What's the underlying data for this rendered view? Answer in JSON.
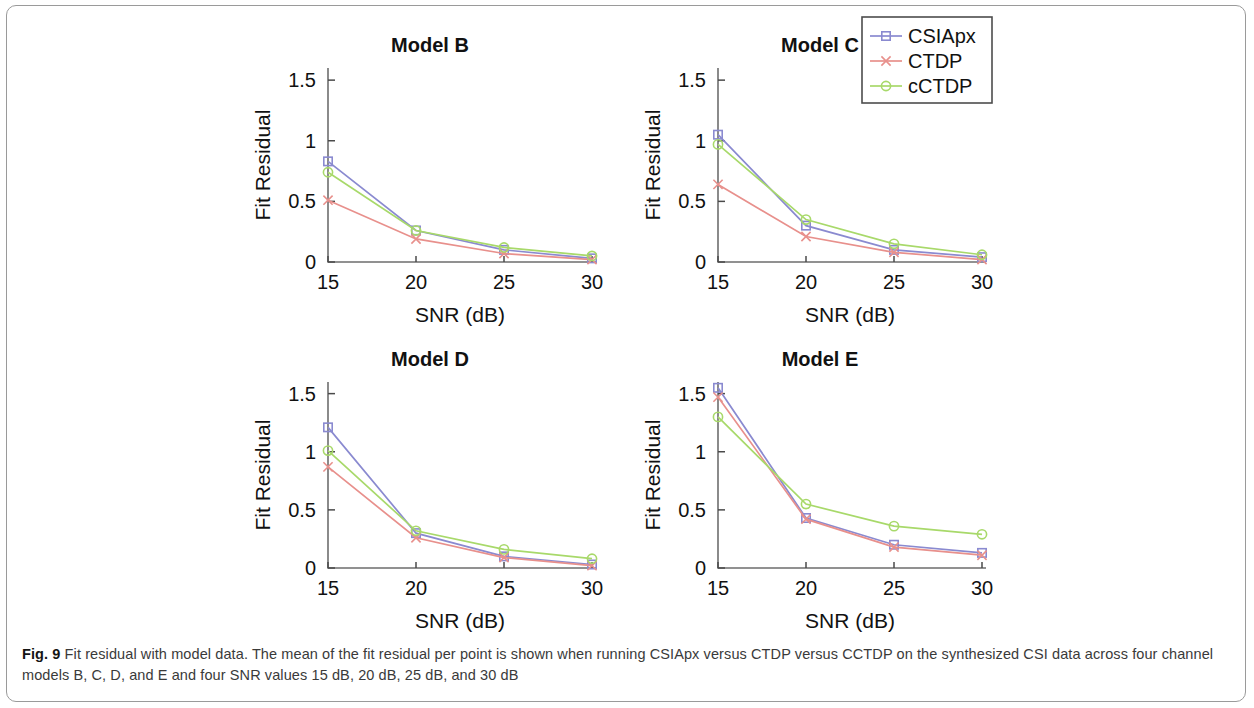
{
  "figure": {
    "caption_label": "Fig. 9",
    "caption_text": " Fit residual with model data. The mean of the fit residual per point is shown when running CSIApx versus CTDP versus CCTDP on the synthesized CSI data across four channel models B, C, D, and E and four SNR values 15 dB, 20 dB, 25 dB, and 30 dB"
  },
  "legend": {
    "position": "top-right",
    "entries": [
      {
        "label": "CSIApx",
        "color": "#8a8ad0",
        "marker": "square"
      },
      {
        "label": "CTDP",
        "color": "#e8908c",
        "marker": "cross"
      },
      {
        "label": "cCTDP",
        "color": "#a8d96a",
        "marker": "circle"
      }
    ]
  },
  "colors": {
    "csiapx": "#8a8ad0",
    "ctdp": "#e8908c",
    "cctdp": "#a8d96a",
    "axis": "#6e6e6e",
    "text": "#111111",
    "frame": "#9a9a9a"
  },
  "axes": {
    "xlabel": "SNR (dB)",
    "ylabel": "Fit Residual",
    "xticks": [
      "15",
      "20",
      "25",
      "30"
    ],
    "yticks": [
      "0",
      "0.5",
      "1",
      "1.5"
    ],
    "xlim": [
      15,
      30
    ],
    "ylim": [
      0,
      1.6
    ],
    "grid": false
  },
  "chart_data": [
    {
      "type": "line",
      "title": "Model B",
      "xlabel": "SNR (dB)",
      "ylabel": "Fit Residual",
      "x": [
        15,
        20,
        25,
        30
      ],
      "xticklabels": [
        "15",
        "20",
        "25",
        "30"
      ],
      "yticks": [
        0,
        0.5,
        1,
        1.5
      ],
      "yticklabels": [
        "0",
        "0.5",
        "1",
        "1.5"
      ],
      "xlim": [
        15,
        30
      ],
      "ylim": [
        0,
        1.6
      ],
      "grid": false,
      "series": [
        {
          "name": "CSIApx",
          "color": "#8a8ad0",
          "marker": "square",
          "values": [
            0.83,
            0.26,
            0.1,
            0.03
          ]
        },
        {
          "name": "CTDP",
          "color": "#e8908c",
          "marker": "cross",
          "values": [
            0.51,
            0.19,
            0.07,
            0.02
          ]
        },
        {
          "name": "cCTDP",
          "color": "#a8d96a",
          "marker": "circle",
          "values": [
            0.74,
            0.26,
            0.12,
            0.05
          ]
        }
      ]
    },
    {
      "type": "line",
      "title": "Model C",
      "xlabel": "SNR (dB)",
      "ylabel": "Fit Residual",
      "x": [
        15,
        20,
        25,
        30
      ],
      "xticklabels": [
        "15",
        "20",
        "25",
        "30"
      ],
      "yticks": [
        0,
        0.5,
        1,
        1.5
      ],
      "yticklabels": [
        "0",
        "0.5",
        "1",
        "1.5"
      ],
      "xlim": [
        15,
        30
      ],
      "ylim": [
        0,
        1.6
      ],
      "grid": false,
      "series": [
        {
          "name": "CSIApx",
          "color": "#8a8ad0",
          "marker": "square",
          "values": [
            1.05,
            0.3,
            0.1,
            0.04
          ]
        },
        {
          "name": "CTDP",
          "color": "#e8908c",
          "marker": "cross",
          "values": [
            0.64,
            0.21,
            0.08,
            0.02
          ]
        },
        {
          "name": "cCTDP",
          "color": "#a8d96a",
          "marker": "circle",
          "values": [
            0.97,
            0.35,
            0.15,
            0.06
          ]
        }
      ]
    },
    {
      "type": "line",
      "title": "Model D",
      "xlabel": "SNR (dB)",
      "ylabel": "Fit Residual",
      "x": [
        15,
        20,
        25,
        30
      ],
      "xticklabels": [
        "15",
        "20",
        "25",
        "30"
      ],
      "yticks": [
        0,
        0.5,
        1,
        1.5
      ],
      "yticklabels": [
        "0",
        "0.5",
        "1",
        "1.5"
      ],
      "xlim": [
        15,
        30
      ],
      "ylim": [
        0,
        1.6
      ],
      "grid": false,
      "series": [
        {
          "name": "CSIApx",
          "color": "#8a8ad0",
          "marker": "square",
          "values": [
            1.21,
            0.3,
            0.1,
            0.03
          ]
        },
        {
          "name": "CTDP",
          "color": "#e8908c",
          "marker": "cross",
          "values": [
            0.87,
            0.26,
            0.09,
            0.02
          ]
        },
        {
          "name": "cCTDP",
          "color": "#a8d96a",
          "marker": "circle",
          "values": [
            1.01,
            0.32,
            0.16,
            0.08
          ]
        }
      ]
    },
    {
      "type": "line",
      "title": "Model E",
      "xlabel": "SNR (dB)",
      "ylabel": "Fit Residual",
      "x": [
        15,
        20,
        25,
        30
      ],
      "xticklabels": [
        "15",
        "20",
        "25",
        "30"
      ],
      "yticks": [
        0,
        0.5,
        1,
        1.5
      ],
      "yticklabels": [
        "0",
        "0.5",
        "1",
        "1.5"
      ],
      "xlim": [
        15,
        30
      ],
      "ylim": [
        0,
        1.6
      ],
      "grid": false,
      "series": [
        {
          "name": "CSIApx",
          "color": "#8a8ad0",
          "marker": "square",
          "values": [
            1.55,
            0.43,
            0.2,
            0.13
          ]
        },
        {
          "name": "CTDP",
          "color": "#e8908c",
          "marker": "cross",
          "values": [
            1.47,
            0.42,
            0.18,
            0.11
          ]
        },
        {
          "name": "cCTDP",
          "color": "#a8d96a",
          "marker": "circle",
          "values": [
            1.3,
            0.55,
            0.36,
            0.29
          ]
        }
      ]
    }
  ]
}
